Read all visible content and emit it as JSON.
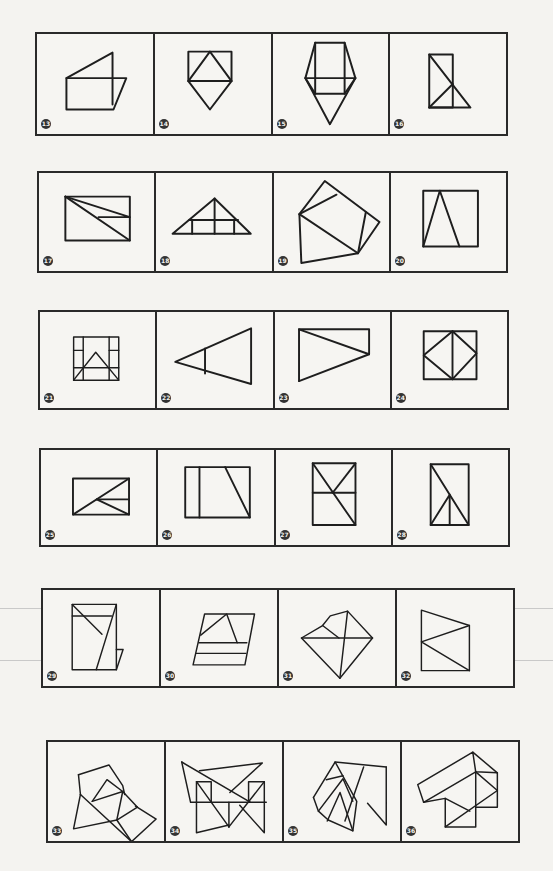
{
  "worksheet": {
    "title": "Geometric figure exercises",
    "rows": [
      {
        "figures": [
          {
            "number": "13",
            "shape": "rectangle-with-triangle-and-parallelogram"
          },
          {
            "number": "14",
            "shape": "square-with-inscribed-triangle-and-diamond"
          },
          {
            "number": "15",
            "shape": "rectangle-with-side-triangles-and-bottom-point"
          },
          {
            "number": "16",
            "shape": "rectangle-with-diagonal-and-triangle"
          }
        ]
      },
      {
        "figures": [
          {
            "number": "17",
            "shape": "rectangle-with-diagonals"
          },
          {
            "number": "18",
            "shape": "triangle-with-grid"
          },
          {
            "number": "19",
            "shape": "pentagon-with-squares"
          },
          {
            "number": "20",
            "shape": "square-with-triangle"
          }
        ]
      },
      {
        "figures": [
          {
            "number": "21",
            "shape": "grid-square-with-triangle"
          },
          {
            "number": "22",
            "shape": "triangle-with-inner-line"
          },
          {
            "number": "23",
            "shape": "rectangle-with-triangle"
          },
          {
            "number": "24",
            "shape": "square-with-diamond"
          }
        ]
      },
      {
        "figures": [
          {
            "number": "25",
            "shape": "rectangle-with-fan-lines"
          },
          {
            "number": "26",
            "shape": "rectangle-with-vertical-and-slant"
          },
          {
            "number": "27",
            "shape": "rectangle-with-x-and-midline"
          },
          {
            "number": "28",
            "shape": "rectangle-with-diagonal-and-triangle"
          }
        ]
      },
      {
        "figures": [
          {
            "number": "29",
            "shape": "rectangle-with-slants"
          },
          {
            "number": "30",
            "shape": "trapezoid-stack"
          },
          {
            "number": "31",
            "shape": "pentagon-with-chords"
          },
          {
            "number": "32",
            "shape": "square-with-arrow"
          }
        ]
      },
      {
        "figures": [
          {
            "number": "33",
            "shape": "composite-squares"
          },
          {
            "number": "34",
            "shape": "overlapping-triangles-and-rectangles"
          },
          {
            "number": "35",
            "shape": "zigzag-composite"
          },
          {
            "number": "36",
            "shape": "house-composite"
          }
        ]
      }
    ]
  }
}
